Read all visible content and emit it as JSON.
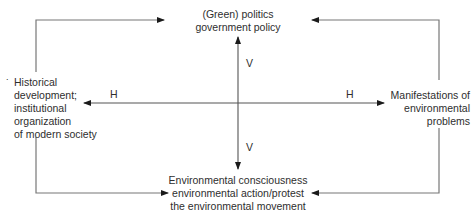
{
  "diagram": {
    "nodes": {
      "top": {
        "lines": [
          "(Green) politics",
          "government policy"
        ]
      },
      "left": {
        "lines": [
          "Historical",
          "development;",
          "institutional",
          "organization",
          "of modern society"
        ]
      },
      "right": {
        "lines": [
          "Manifestations of",
          "environmental",
          "problems"
        ]
      },
      "bottom": {
        "lines": [
          "Environmental consciousness",
          "environmental action/protest",
          "the environmental movement"
        ]
      }
    },
    "axis_labels": {
      "h_left": "H",
      "h_right": "H",
      "v_top": "V",
      "v_bottom": "V"
    },
    "stray_mark": ".",
    "line_color": "#777777",
    "arrow_color": "#1a1a1a"
  }
}
